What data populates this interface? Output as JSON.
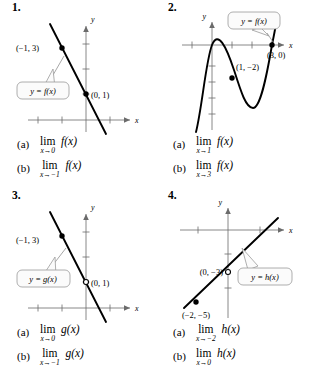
{
  "page": {
    "background": "#ffffff",
    "ink": "#000000",
    "axis_color": "#6b6b6b",
    "callout_fill": "#fbfbfb",
    "callout_stroke": "#9a9a9a"
  },
  "problems": [
    {
      "number": "1.",
      "figure": {
        "axis_x_label": "x",
        "axis_y_label": "y",
        "callout_label": "y = f(x)",
        "points": [
          {
            "label": "(−1, 3)",
            "marker": "filled"
          },
          {
            "label": "(0, 1)",
            "marker": "filled"
          }
        ],
        "curve_type": "line-decreasing"
      },
      "answers": [
        {
          "tag": "(a)",
          "op": "lim",
          "sub": "x→0",
          "expr": "f(x)"
        },
        {
          "tag": "(b)",
          "op": "lim",
          "sub": "x→−1",
          "expr": "f(x)"
        }
      ]
    },
    {
      "number": "2.",
      "figure": {
        "axis_x_label": "x",
        "axis_y_label": "y",
        "callout_label": "y = f(x)",
        "points": [
          {
            "label": "(1, −2)",
            "marker": "filled"
          },
          {
            "label": "(3, 0)",
            "marker": "filled"
          }
        ],
        "curve_type": "cubic"
      },
      "answers": [
        {
          "tag": "(a)",
          "op": "lim",
          "sub": "x→1",
          "expr": "f(x)"
        },
        {
          "tag": "(b)",
          "op": "lim",
          "sub": "x→3",
          "expr": "f(x)"
        }
      ]
    },
    {
      "number": "3.",
      "figure": {
        "axis_x_label": "x",
        "axis_y_label": "y",
        "callout_label": "y = g(x)",
        "points": [
          {
            "label": "(−1, 3)",
            "marker": "filled"
          },
          {
            "label": "(0, 1)",
            "marker": "open"
          }
        ],
        "curve_type": "line-decreasing"
      },
      "answers": [
        {
          "tag": "(a)",
          "op": "lim",
          "sub": "x→0",
          "expr": "g(x)"
        },
        {
          "tag": "(b)",
          "op": "lim",
          "sub": "x→−1",
          "expr": "g(x)"
        }
      ]
    },
    {
      "number": "4.",
      "figure": {
        "axis_x_label": "x",
        "axis_y_label": "y",
        "callout_label": "y = h(x)",
        "points": [
          {
            "label": "(0, −3)",
            "marker": "open"
          },
          {
            "label": "(−2, −5)",
            "marker": "filled"
          }
        ],
        "curve_type": "line-increasing"
      },
      "answers": [
        {
          "tag": "(a)",
          "op": "lim",
          "sub": "x→−2",
          "expr": "h(x)"
        },
        {
          "tag": "(b)",
          "op": "lim",
          "sub": "x→0",
          "expr": "h(x)"
        }
      ]
    }
  ]
}
